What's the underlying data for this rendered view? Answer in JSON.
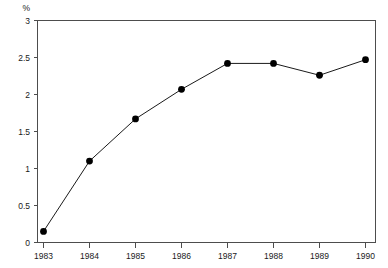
{
  "chart_data": {
    "type": "line",
    "title": "",
    "subtitle": "",
    "xlabel": "",
    "ylabel": "%",
    "ylabel_position": "top-left",
    "categories": [
      "1983",
      "1984",
      "1985",
      "1986",
      "1987",
      "1988",
      "1989",
      "1990"
    ],
    "x": [
      1983,
      1984,
      1985,
      1986,
      1987,
      1988,
      1989,
      1990
    ],
    "values": [
      0.15,
      1.1,
      1.67,
      2.07,
      2.42,
      2.42,
      2.26,
      2.47
    ],
    "series": [
      {
        "name": "",
        "values": [
          0.15,
          1.1,
          1.67,
          2.07,
          2.42,
          2.42,
          2.26,
          2.47
        ]
      }
    ],
    "ylim": [
      0,
      3
    ],
    "ytick_values": [
      0,
      0.5,
      1,
      1.5,
      2,
      2.5,
      3
    ],
    "ytick_labels": [
      "0",
      "0.5",
      "1",
      "1.5",
      "2",
      "2.5",
      "3"
    ],
    "xtick_labels": [
      "1983",
      "1984",
      "1985",
      "1986",
      "1987",
      "1988",
      "1989",
      "1990"
    ],
    "grid": false,
    "legend": false,
    "legend_position": "none",
    "marker": "filled-circle",
    "line_color": "#1a1a1a",
    "marker_color": "#000000",
    "axis_color": "#4d4d4d",
    "background_color": "#ffffff"
  },
  "axes": {
    "y_axis_unit_label": "%"
  }
}
